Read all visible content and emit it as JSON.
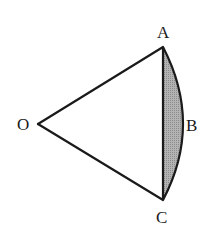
{
  "diagram": {
    "points": {
      "O": {
        "label": "O",
        "x": 38,
        "y": 124
      },
      "A": {
        "label": "A",
        "x": 163,
        "y": 47
      },
      "B": {
        "label": "B",
        "x": 183,
        "y": 124
      },
      "C": {
        "label": "C",
        "x": 163,
        "y": 200
      }
    },
    "segments": [
      "OA",
      "OC",
      "AC"
    ],
    "arc": "ABC",
    "shaded_region": "segment between chord AC and arc ABC",
    "colors": {
      "stroke": "#1a1a1a",
      "shade": "#a9a9a9",
      "background": "#ffffff"
    }
  }
}
